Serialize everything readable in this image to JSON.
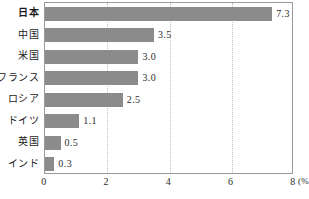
{
  "chart_data": {
    "type": "bar",
    "orientation": "horizontal",
    "title": "",
    "xlabel": "(%)",
    "ylabel": "",
    "xlim": [
      0,
      8
    ],
    "xticks": [
      "0",
      "2",
      "4",
      "6",
      "8"
    ],
    "xtick_values": [
      0,
      2,
      4,
      6,
      8
    ],
    "grid": true,
    "grid_axis": "x",
    "grid_style": "dotted",
    "legend": false,
    "categories": [
      "日本",
      "中国",
      "米国",
      "フランス",
      "ロシア",
      "ドイツ",
      "英国",
      "インド"
    ],
    "values": [
      7.3,
      3.5,
      3.0,
      3.0,
      2.5,
      1.1,
      0.5,
      0.3
    ],
    "value_labels": [
      "7.3",
      "3.5",
      "3.0",
      "3.0",
      "2.5",
      "1.1",
      "0.5",
      "0.3"
    ],
    "emphasized_category": "日本",
    "bar_color": "#8b8b8b",
    "frame_color": "#9a9a9a",
    "grid_color": "#c2c2c2",
    "text_color": "#1a1a1a",
    "unit_suffix": "(%)"
  }
}
